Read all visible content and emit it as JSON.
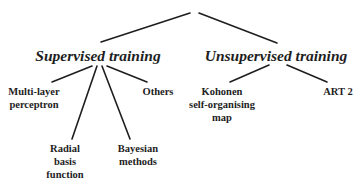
{
  "diagram": {
    "type": "tree",
    "root": {
      "label": "",
      "children": [
        {
          "id": "supervised",
          "label": "Supervised training",
          "children": [
            {
              "id": "mlp",
              "lines": [
                "Multi-layer",
                "perceptron"
              ]
            },
            {
              "id": "rbf",
              "lines": [
                "Radial",
                "basis",
                "function"
              ]
            },
            {
              "id": "bayes",
              "lines": [
                "Bayesian",
                "methods"
              ]
            },
            {
              "id": "others",
              "lines": [
                "Others"
              ]
            }
          ]
        },
        {
          "id": "unsupervised",
          "label": "Unsupervised training",
          "children": [
            {
              "id": "kohonen",
              "lines": [
                "Kohonen",
                "self-organising",
                "map"
              ]
            },
            {
              "id": "art2",
              "lines": [
                "ART 2"
              ]
            }
          ]
        }
      ]
    },
    "colors": {
      "line": "#1e1e1e",
      "text": "#1e1e1e",
      "background": "#ffffff"
    }
  }
}
